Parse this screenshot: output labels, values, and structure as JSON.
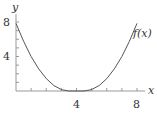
{
  "chart_data": {
    "type": "line",
    "title": "",
    "xlabel": "x",
    "ylabel": "y",
    "xlim": [
      0,
      8
    ],
    "ylim": [
      0,
      8
    ],
    "x_ticks_labeled": [
      4,
      8
    ],
    "y_ticks_labeled": [
      4,
      8
    ],
    "minor_tick_step": 1,
    "grid": false,
    "legend": null,
    "annotations": [
      {
        "text": "f(x)",
        "x": 8,
        "y": 7.4
      }
    ],
    "series": [
      {
        "name": "f(x)",
        "x": [
          0,
          0.5,
          1,
          1.5,
          2,
          2.5,
          3,
          3.5,
          4,
          4.5,
          5,
          5.5,
          6,
          6.5,
          7,
          7.5,
          8
        ],
        "values": [
          7.84,
          5.76,
          4.0,
          2.56,
          1.44,
          0.64,
          0.16,
          0.0,
          0.0,
          0.0,
          0.16,
          0.64,
          1.44,
          2.56,
          4.0,
          5.76,
          7.84
        ]
      }
    ]
  },
  "labels": {
    "y_axis": "y",
    "x_axis": "x",
    "y_tick_8": "8",
    "y_tick_4": "4",
    "x_tick_4": "4",
    "x_tick_8": "8",
    "curve": "f(x)"
  },
  "colors": {
    "axis": "#999999",
    "curve": "#555555",
    "text": "#333333"
  }
}
